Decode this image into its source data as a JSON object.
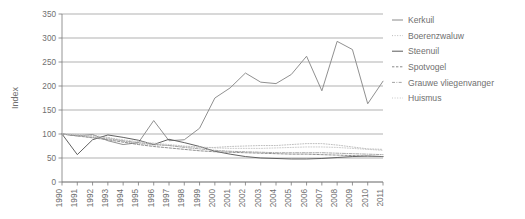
{
  "chart_data": {
    "type": "line",
    "title": "",
    "xlabel": "",
    "ylabel": "Index",
    "ylim": [
      0,
      350
    ],
    "yticks": [
      0,
      50,
      100,
      150,
      200,
      250,
      300,
      350
    ],
    "ytick_labels": [
      "0",
      "50",
      "100",
      "150",
      "200",
      "250",
      "300",
      "350"
    ],
    "grid": true,
    "legend_position": "right",
    "x": [
      1990,
      1991,
      1992,
      1993,
      1994,
      1995,
      1996,
      1997,
      1998,
      1999,
      2000,
      2001,
      2002,
      2003,
      2004,
      2005,
      2006,
      2007,
      2008,
      2009,
      2010,
      2011
    ],
    "xtick_labels": [
      "1990",
      "1991",
      "1992",
      "1993",
      "1994",
      "1995",
      "1996",
      "1997",
      "1998",
      "1999",
      "2000",
      "2001",
      "2002",
      "2003",
      "2004",
      "2005",
      "2006",
      "2007",
      "2008",
      "2009",
      "2010",
      "2011"
    ],
    "series": [
      {
        "name": "Kerkuil",
        "color": "#8a8a8a",
        "style": "solid",
        "values": [
          100,
          96,
          99,
          86,
          78,
          82,
          128,
          86,
          88,
          112,
          175,
          196,
          227,
          208,
          205,
          224,
          262,
          190,
          293,
          276,
          163,
          210
        ]
      },
      {
        "name": "Boerenzwaluw",
        "color": "#b4b4b4",
        "style": "dotted",
        "values": [
          100,
          99,
          97,
          93,
          85,
          80,
          77,
          76,
          74,
          72,
          72,
          74,
          75,
          76,
          76,
          78,
          80,
          80,
          77,
          73,
          69,
          68
        ]
      },
      {
        "name": "Steenuil",
        "color": "#5a5a5a",
        "style": "solid",
        "values": [
          100,
          57,
          88,
          98,
          93,
          87,
          78,
          89,
          82,
          74,
          64,
          58,
          53,
          50,
          49,
          48,
          48,
          49,
          51,
          53,
          54,
          53
        ]
      },
      {
        "name": "Spotvogel",
        "color": "#7d7d7d",
        "style": "dashed",
        "values": [
          100,
          96,
          92,
          88,
          83,
          78,
          74,
          71,
          68,
          65,
          63,
          62,
          61,
          60,
          59,
          58,
          58,
          57,
          56,
          55,
          54,
          53
        ]
      },
      {
        "name": "Grauwe vliegenvanger",
        "color": "#999999",
        "style": "dashdot",
        "values": [
          100,
          97,
          93,
          90,
          86,
          82,
          79,
          76,
          72,
          69,
          66,
          64,
          63,
          62,
          61,
          61,
          61,
          61,
          60,
          59,
          58,
          57
        ]
      },
      {
        "name": "Huismus",
        "color": "#c2c2c2",
        "style": "dotted",
        "values": [
          100,
          98,
          95,
          92,
          88,
          84,
          81,
          78,
          75,
          73,
          71,
          70,
          70,
          70,
          71,
          72,
          73,
          73,
          72,
          70,
          68,
          66
        ]
      }
    ]
  },
  "legend": {
    "items": [
      {
        "label": "Kerkuil"
      },
      {
        "label": "Boerenzwaluw"
      },
      {
        "label": "Steenuil"
      },
      {
        "label": "Spotvogel"
      },
      {
        "label": "Grauwe vliegenvanger"
      },
      {
        "label": "Huismus"
      }
    ]
  }
}
